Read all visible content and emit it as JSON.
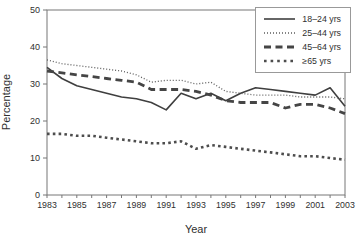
{
  "chart_data": {
    "type": "line",
    "title": "",
    "xlabel": "Year",
    "ylabel": "Percentage",
    "xlim": [
      1983,
      2003
    ],
    "ylim": [
      0,
      50
    ],
    "y_ticks": [
      0,
      10,
      20,
      30,
      40,
      50
    ],
    "x_tick_labels": [
      "1983",
      "1985",
      "1987",
      "1989",
      "1991",
      "1993",
      "1995",
      "1997",
      "1999",
      "2001",
      "2003"
    ],
    "grid": "off",
    "legend_position": "upper right",
    "x": [
      1983,
      1984,
      1985,
      1986,
      1987,
      1988,
      1989,
      1990,
      1991,
      1992,
      1993,
      1994,
      1995,
      1996,
      1997,
      1998,
      1999,
      2000,
      2001,
      2002,
      2003
    ],
    "series": [
      {
        "name": "18–24 yrs",
        "style": "solid",
        "values": [
          34.5,
          31.5,
          29.5,
          28.5,
          27.5,
          26.5,
          26,
          25,
          23,
          27.5,
          26,
          27.5,
          25.5,
          27.5,
          29,
          28.5,
          28,
          27.5,
          27,
          29,
          24
        ]
      },
      {
        "name": "25–44 yrs",
        "style": "fine-dotted",
        "values": [
          36.5,
          35.5,
          35,
          34.5,
          34,
          33.5,
          32.5,
          30.5,
          31,
          31,
          30,
          30.5,
          28,
          27.5,
          27,
          27,
          27,
          26.5,
          26.5,
          26.5,
          26
        ]
      },
      {
        "name": "45–64 yrs",
        "style": "thick-dashed",
        "values": [
          33.5,
          33,
          32.5,
          32,
          31.5,
          31,
          30.5,
          28.5,
          28.5,
          28.5,
          28,
          27,
          25.5,
          25,
          25,
          25,
          23.5,
          24.5,
          24.5,
          23.5,
          22
        ]
      },
      {
        "name": "≥65 yrs",
        "style": "square-dotted",
        "values": [
          16.5,
          16.5,
          16,
          16,
          15.5,
          15,
          14.5,
          14,
          14,
          14.5,
          12.5,
          13.5,
          13,
          12.5,
          12,
          11.5,
          11,
          10.5,
          10.5,
          10,
          9.5
        ]
      }
    ]
  },
  "colors": {
    "background": "#ffffff",
    "line": "#3f3f3f",
    "axis": "#777777",
    "text": "#2f2f2f",
    "legend_border": "#999999"
  }
}
